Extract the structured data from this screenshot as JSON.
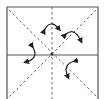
{
  "diagram": {
    "type": "origami-fold-diagram",
    "colors": {
      "background": "#ffffff",
      "stroke": "#333333"
    },
    "square": {
      "x": 7,
      "y": 7,
      "right": 98,
      "bottom": 104
    },
    "center": {
      "x": 52,
      "y": 55
    },
    "fold_lines": [
      {
        "kind": "solid",
        "label": "horizontal-crease"
      },
      {
        "kind": "dashed",
        "label": "vertical-valley-fold"
      },
      {
        "kind": "dashed",
        "label": "diagonal-valley-fold-left"
      },
      {
        "kind": "dashed",
        "label": "diagonal-valley-fold-right"
      }
    ],
    "arrows": [
      {
        "label": "fold-arrow-top"
      },
      {
        "label": "fold-arrow-top-right"
      },
      {
        "label": "fold-arrow-left"
      },
      {
        "label": "fold-arrow-bottom-right"
      }
    ]
  }
}
